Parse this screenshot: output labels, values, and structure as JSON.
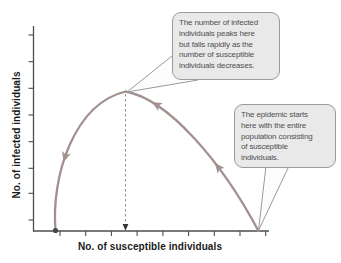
{
  "chart_data": {
    "type": "line",
    "title": "",
    "xlabel": "No. of susceptible individuals",
    "ylabel": "No. of infected individuals",
    "x_axis": {
      "numeric_labels": false,
      "tick_count": 9
    },
    "y_axis": {
      "numeric_labels": false,
      "tick_count": 8
    },
    "grid": false,
    "series": [
      {
        "name": "epidemic trajectory (susceptible-infected phase plane)",
        "direction": "starts at bottom right (all susceptible), rises to a peak, falls to bottom left",
        "points_norm": [
          {
            "susceptible": 1.0,
            "infected": 0.0
          },
          {
            "susceptible": 0.79,
            "infected": 0.49
          },
          {
            "susceptible": 0.51,
            "infected": 0.92
          },
          {
            "susceptible": 0.4,
            "infected": 1.0
          },
          {
            "susceptible": 0.27,
            "infected": 0.9
          },
          {
            "susceptible": 0.13,
            "infected": 0.5
          },
          {
            "susceptible": 0.1,
            "infected": 0.0
          }
        ],
        "peak": {
          "susceptible": 0.4,
          "infected": 1.0
        }
      }
    ],
    "annotations": [
      "The number of infected individuals peaks here but falls rapidly as the number of susceptible individuals decreases.",
      "The epidemic starts here with the entire population consisting of susceptible individuals."
    ],
    "colors": {
      "curve": "#a39190",
      "axis": "#4d4d4d",
      "dashed": "#8f8f8f",
      "dashed_arrow": "#333333",
      "end_dot": "#474747",
      "callout_bg": "#e9e9e9",
      "callout_border": "#9a9a9a",
      "callout_text": "#4f4f4f",
      "tail_fill": "#fdfdfd"
    }
  },
  "callouts": {
    "peak": {
      "text": "The number of infected\nindividuals peaks here\nbut falls rapidly as the\nnumber of susceptible\nindividuals decreases."
    },
    "start": {
      "text": "The epidemic starts\nhere with the entire\npopulation consisting\nof susceptible\nindividuals."
    }
  },
  "render": {
    "curve_path": "M55.5,231 C51,176 74,104 125.5,91.5 C168,99 222,162 258.5,231",
    "arrows": [
      {
        "transform": "translate(63.5,162) rotate(107)"
      },
      {
        "transform": "translate(152,102) rotate(211)"
      },
      {
        "transform": "translate(215,163) rotate(232)"
      }
    ],
    "dashed_line": {
      "x1": 125.5,
      "y1": 94,
      "x2": 125.5,
      "y2": 224
    },
    "dashed_arrow_path": "M125.5,230.5 L122.6,224 L128.4,224 Z",
    "end_dot": {
      "cx": 55.5,
      "cy": 230.5,
      "r": 2.6
    },
    "tails": {
      "top": "127,92 177,52 198,80",
      "right": "258.5,230.5 266,166 289,166"
    },
    "axes": {
      "y": {
        "x": 33.5,
        "y1": 26,
        "y2": 231.5
      },
      "x": {
        "y": 231,
        "x1": 33,
        "x2": 269
      }
    },
    "y_ticks": {
      "x": 33.5,
      "len": 5,
      "ys": [
        35,
        61.7,
        88.3,
        115,
        141.7,
        168.3,
        193.3,
        220
      ]
    },
    "x_ticks": {
      "y": 231,
      "len": 5,
      "xs": [
        60,
        85.7,
        111.4,
        137.1,
        162.9,
        188.6,
        214.3,
        240,
        265.7
      ]
    }
  }
}
